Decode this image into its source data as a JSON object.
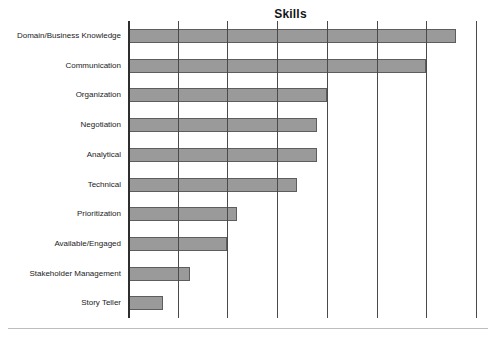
{
  "chart_data": {
    "type": "bar",
    "orientation": "horizontal",
    "title": "Skills",
    "xlabel": "",
    "ylabel": "",
    "categories": [
      "Domain/Business Knowledge",
      "Communication",
      "Organization",
      "Negotiation",
      "Analytical",
      "Technical",
      "Prioritization",
      "Available/Engaged",
      "Stakeholder Management",
      "Story Teller"
    ],
    "values": [
      6.6,
      6.0,
      4.0,
      3.8,
      3.8,
      3.4,
      2.2,
      2.0,
      1.25,
      0.7
    ],
    "xlim": [
      0,
      7
    ],
    "ylim": [
      0,
      10
    ],
    "x_tick_labels": [],
    "y_tick_labels": [],
    "gridlines": {
      "vertical": [
        1,
        2,
        3,
        4,
        5,
        6,
        7
      ],
      "horizontal": []
    },
    "legend": null,
    "legend_position": "none",
    "bar_color": "#9a9a9a",
    "bar_border_color": "#5d5d5d",
    "axis_color": "#3b3b3b",
    "grid_color": "#4a4a4a",
    "title_color": "#151515",
    "label_color": "#1b1b1b",
    "background": "#ffffff"
  }
}
